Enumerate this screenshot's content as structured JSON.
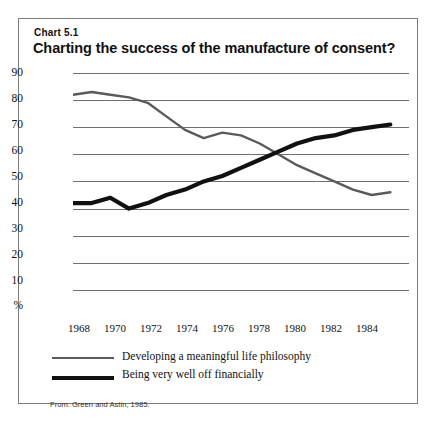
{
  "chart_number": "Chart 5.1",
  "title": "Charting the success of the manufacture of consent?",
  "source": "From: Green and Astin, 1985.",
  "legend": [
    {
      "key": "philosophy",
      "label": "Developing a meaningful life philosophy",
      "style": "thin-gray-line",
      "color": "#5a5a5a",
      "width": 2
    },
    {
      "key": "financial",
      "label": "Being very well off financially",
      "style": "thick-black-line",
      "color": "#111111",
      "width": 4
    }
  ],
  "axes": {
    "y_ticks": [
      "90",
      "80",
      "70",
      "60",
      "50",
      "40",
      "30",
      "20",
      "10",
      "%"
    ],
    "y_values": [
      90,
      80,
      70,
      60,
      50,
      40,
      30,
      20,
      10,
      0
    ],
    "x_ticks": [
      "1968",
      "1970",
      "1972",
      "1974",
      "1976",
      "1978",
      "1980",
      "1982",
      "1984"
    ],
    "y_unit": "%"
  },
  "chart_data": {
    "type": "line",
    "title": "Charting the success of the manufacture of consent?",
    "subtitle": "Chart 5.1",
    "xlabel": "",
    "ylabel": "%",
    "xlim": [
      1967,
      1985
    ],
    "ylim": [
      0,
      90
    ],
    "grid": true,
    "legend_position": "below",
    "x": [
      1967,
      1968,
      1969,
      1970,
      1971,
      1972,
      1973,
      1974,
      1975,
      1976,
      1977,
      1978,
      1979,
      1980,
      1981,
      1982,
      1983,
      1984
    ],
    "series": [
      {
        "name": "Developing a meaningful life philosophy",
        "color": "#5a5a5a",
        "values": [
          82,
          83,
          82,
          81,
          79,
          74,
          69,
          66,
          68,
          67,
          64,
          60,
          56,
          53,
          50,
          47,
          45,
          46
        ]
      },
      {
        "name": "Being very well off financially",
        "color": "#111111",
        "values": [
          42,
          42,
          44,
          40,
          42,
          45,
          47,
          50,
          52,
          55,
          58,
          61,
          64,
          66,
          67,
          69,
          70,
          71
        ]
      }
    ],
    "annotations": [
      "Lines cross between 1977 and 1978 at about 60%"
    ]
  }
}
